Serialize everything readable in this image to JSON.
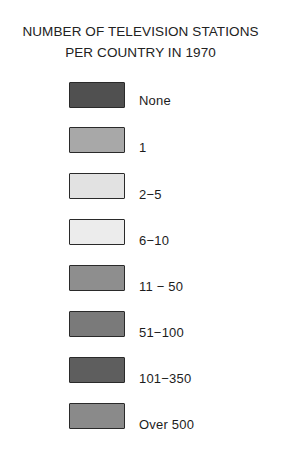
{
  "legend": {
    "title_line1": "NUMBER OF TELEVISION STATIONS",
    "title_line2": "PER COUNTRY IN 1970",
    "items": [
      {
        "label": "None",
        "color": "#505050"
      },
      {
        "label": "1",
        "color": "#a8a8a8"
      },
      {
        "label": "2−5",
        "color": "#e2e2e2"
      },
      {
        "label": "6−10",
        "color": "#ececec"
      },
      {
        "label": "11 − 50",
        "color": "#8e8e8e"
      },
      {
        "label": "51−100",
        "color": "#7a7a7a"
      },
      {
        "label": "101−350",
        "color": "#5e5e5e"
      },
      {
        "label": "Over 500",
        "color": "#8a8a8a"
      }
    ]
  }
}
